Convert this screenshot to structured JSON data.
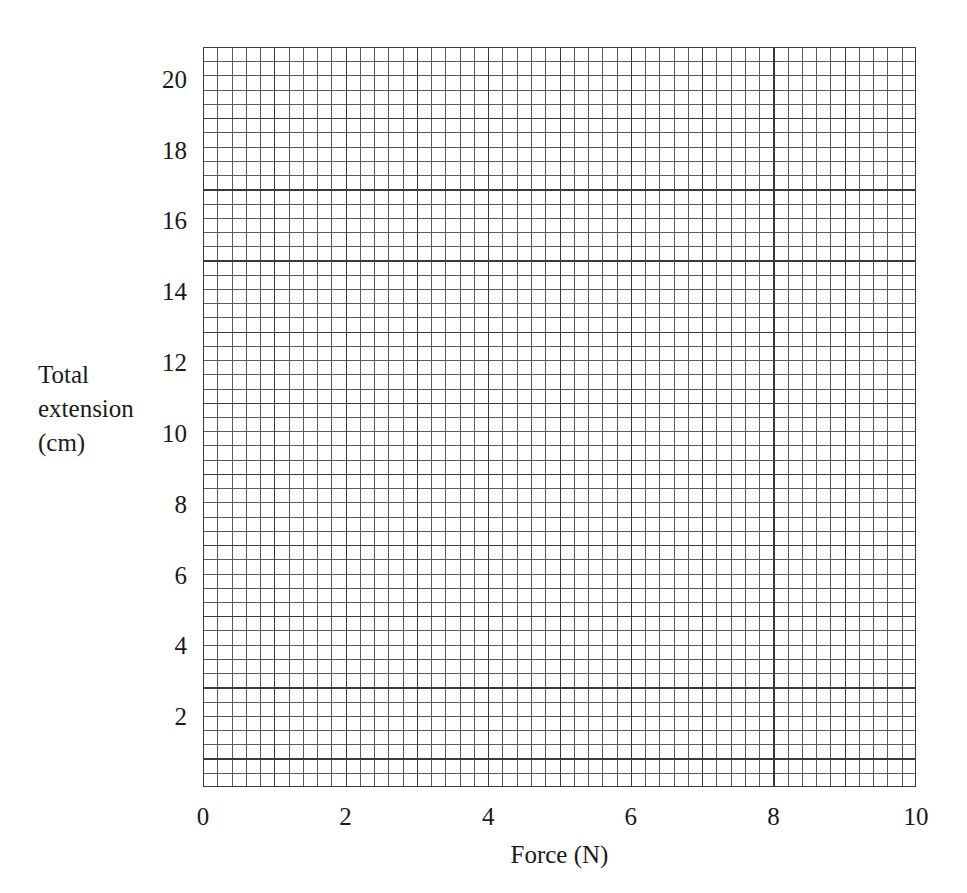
{
  "figure": {
    "kind": "graph-paper-blank-grid",
    "background_color": "#ffffff",
    "grid_minor_color": "#5a5a5a",
    "grid_major_color": "#3a3a3a"
  },
  "chart_data": {
    "type": "line",
    "title": "",
    "subtitle": "",
    "xlabel": "Force (N)",
    "ylabel": "Total extension (cm)",
    "ylabel_lines": [
      "Total",
      "extension",
      "(cm)"
    ],
    "xlim": [
      0,
      10
    ],
    "ylim": [
      0,
      20.9
    ],
    "xticks": [
      0,
      2,
      4,
      6,
      8,
      10
    ],
    "xtick_labels": [
      "0",
      "2",
      "4",
      "6",
      "8",
      "10"
    ],
    "yticks": [
      2,
      4,
      6,
      8,
      10,
      12,
      14,
      16,
      18,
      20
    ],
    "ytick_labels": [
      "2",
      "4",
      "6",
      "8",
      "10",
      "12",
      "14",
      "16",
      "18",
      "20"
    ],
    "grid": true,
    "grid_minor": true,
    "minor_cells_per_x_unit": 5,
    "minor_cells_per_y_unit": 2.5,
    "legend": null,
    "legend_position": "none",
    "series": [],
    "annotations": [],
    "note": "Blank graph paper grid; no data series plotted"
  },
  "axes": {
    "y": {
      "title_lines": [
        "Total",
        "extension",
        "(cm)"
      ],
      "ticks": [
        {
          "label": "20",
          "value": 20
        },
        {
          "label": "18",
          "value": 18
        },
        {
          "label": "16",
          "value": 16
        },
        {
          "label": "14",
          "value": 14
        },
        {
          "label": "12",
          "value": 12
        },
        {
          "label": "10",
          "value": 10
        },
        {
          "label": "8",
          "value": 8
        },
        {
          "label": "6",
          "value": 6
        },
        {
          "label": "4",
          "value": 4
        },
        {
          "label": "2",
          "value": 2
        }
      ]
    },
    "x": {
      "title": "Force (N)",
      "ticks": [
        {
          "label": "0",
          "value": 0
        },
        {
          "label": "2",
          "value": 2
        },
        {
          "label": "4",
          "value": 4
        },
        {
          "label": "6",
          "value": 6
        },
        {
          "label": "8",
          "value": 8
        },
        {
          "label": "10",
          "value": 10
        }
      ]
    }
  }
}
